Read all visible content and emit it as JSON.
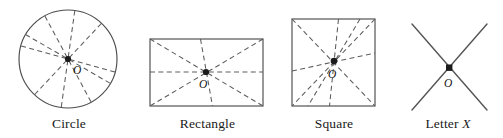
{
  "figure": {
    "background_color": "#ffffff",
    "outline_color": "#4d4d4d",
    "dashed_color": "#5c5c5c",
    "point_color": "#1c1c1c",
    "center_point_label": "O",
    "width": 503,
    "height": 138
  },
  "shapes": [
    {
      "id": "circle",
      "caption": "Circle",
      "center_label": "O",
      "center": {
        "x": 68,
        "y": 59
      },
      "radius": 49,
      "symmetry_line_count": 5,
      "symmetry_line_angles_deg": [
        82,
        118,
        150,
        28,
        56
      ]
    },
    {
      "id": "rectangle",
      "caption": "Rectangle",
      "center_label": "O",
      "center": {
        "x": 206,
        "y": 72
      },
      "bounds": {
        "left": 150,
        "top": 39,
        "width": 113,
        "height": 67
      },
      "symmetry_line_count": 4,
      "symmetry_line_kinds": [
        "diagonal",
        "diagonal",
        "horizontal",
        "vertical-tilted"
      ]
    },
    {
      "id": "square",
      "caption": "Square",
      "center_label": "O",
      "center": {
        "x": 334,
        "y": 61
      },
      "bounds": {
        "left": 292,
        "top": 19,
        "width": 83,
        "height": 87
      },
      "symmetry_line_count": 5,
      "symmetry_line_kinds": [
        "diagonal",
        "diagonal",
        "vertical-tilted",
        "horizontal-tilted",
        "extra-diagonal"
      ]
    },
    {
      "id": "letter-x",
      "caption_prefix": "Letter ",
      "caption_italic": "X",
      "caption": "Letter X",
      "center_label": "O",
      "center": {
        "x": 449,
        "y": 68
      },
      "bounds": {
        "left": 412,
        "top": 24,
        "width": 75,
        "height": 86
      },
      "symmetry_line_count": 2,
      "symmetry_line_kinds": [
        "stroke",
        "stroke"
      ]
    }
  ]
}
